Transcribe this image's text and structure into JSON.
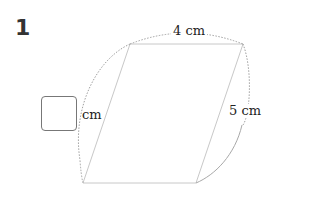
{
  "problem": {
    "number": "1",
    "shape": "parallelogram",
    "labels": {
      "top": "4 cm",
      "right": "5 cm",
      "left_unit": "cm"
    },
    "answer_box": {
      "value": ""
    }
  },
  "colors": {
    "shape_line": "#c8c8c8",
    "arc_line": "#9a9a9a",
    "text": "#222222",
    "box_border": "#777777"
  }
}
